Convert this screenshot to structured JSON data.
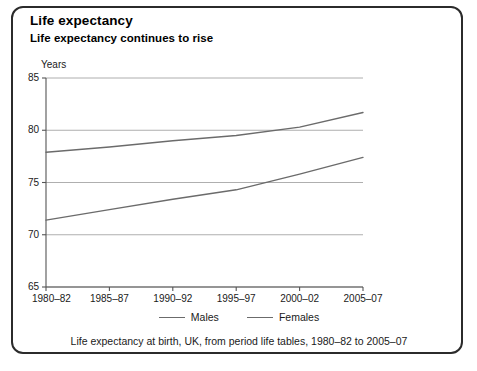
{
  "panel": {
    "title": "Life expectancy",
    "subtitle": "Life expectancy continues to rise",
    "footnote": "Life expectancy at birth, UK, from period life tables, 1980–82 to 2005–07"
  },
  "legend": {
    "position": "bottom",
    "items": [
      {
        "label": "Males",
        "color": "#6b6b6b"
      },
      {
        "label": "Females",
        "color": "#6b6b6b"
      }
    ]
  },
  "chart_data": {
    "type": "line",
    "title": "Life expectancy continues to rise",
    "xlabel": "",
    "ylabel": "Years",
    "ylim": [
      65,
      85
    ],
    "yticks": [
      65,
      70,
      75,
      80,
      85
    ],
    "grid": true,
    "grid_axis": "y",
    "categories": [
      "1980–82",
      "1985–87",
      "1990–92",
      "1995–97",
      "2000–02",
      "2005–07"
    ],
    "series": [
      {
        "name": "Males",
        "color": "#6b6b6b",
        "values": [
          71.4,
          72.4,
          73.4,
          74.3,
          75.8,
          77.4
        ]
      },
      {
        "name": "Females",
        "color": "#6b6b6b",
        "values": [
          77.9,
          78.4,
          79.0,
          79.5,
          80.3,
          81.7
        ]
      }
    ]
  }
}
